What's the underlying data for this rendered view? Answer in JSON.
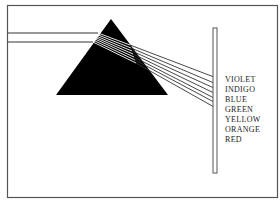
{
  "diagram": {
    "title": "",
    "colors": {
      "frame": "#555555",
      "prism": "#000000",
      "ray": "#333333",
      "screen": "#666666",
      "background": "#ffffff"
    },
    "spectrum_labels": [
      {
        "label": "VIOLET",
        "y": 75
      },
      {
        "label": "INDIGO",
        "y": 85
      },
      {
        "label": "BLUE",
        "y": 95
      },
      {
        "label": "GREEN",
        "y": 105
      },
      {
        "label": "YELLOW",
        "y": 115
      },
      {
        "label": "ORANGE",
        "y": 125
      },
      {
        "label": "RED",
        "y": 135
      }
    ]
  }
}
